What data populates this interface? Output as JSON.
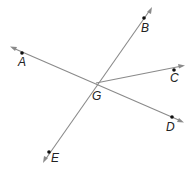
{
  "diagram": {
    "type": "geometry-lines-rays",
    "intersection": {
      "label": "G",
      "x": 96,
      "y": 83
    },
    "lines": [
      {
        "name": "line-AD",
        "through": [
          "A",
          "G",
          "D"
        ]
      },
      {
        "name": "line-BE",
        "through": [
          "B",
          "G",
          "E"
        ]
      }
    ],
    "rays": [
      {
        "name": "ray-GC",
        "from": "G",
        "through": "C"
      }
    ],
    "points": [
      {
        "label": "A",
        "x": 22,
        "y": 53
      },
      {
        "label": "B",
        "x": 144,
        "y": 18
      },
      {
        "label": "C",
        "x": 174,
        "y": 70
      },
      {
        "label": "D",
        "x": 172,
        "y": 117
      },
      {
        "label": "E",
        "x": 49,
        "y": 152
      }
    ],
    "labels": {
      "A": "A",
      "B": "B",
      "C": "C",
      "D": "D",
      "E": "E",
      "G": "G"
    },
    "colors": {
      "line": "#8a8a8a",
      "point": "#111111",
      "label": "#222222"
    }
  }
}
